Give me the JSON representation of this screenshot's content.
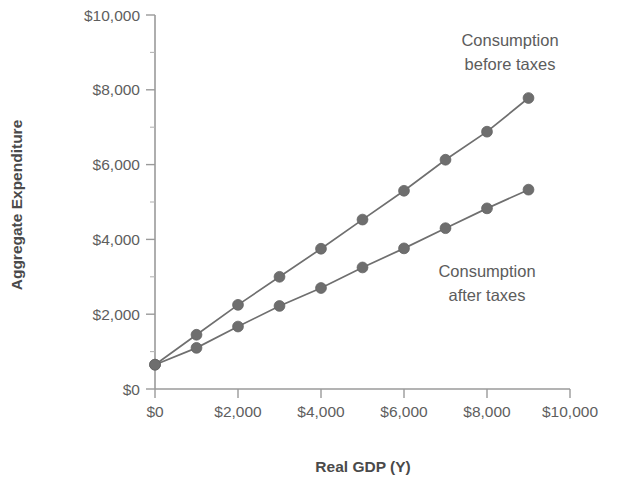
{
  "chart_data": {
    "type": "line",
    "title": "",
    "xlabel": "Real GDP (Y)",
    "ylabel": "Aggregate Expenditure",
    "xlim": [
      0,
      10000
    ],
    "ylim": [
      0,
      10000
    ],
    "grid": false,
    "legend_position": "inline-annotation",
    "x": [
      0,
      1000,
      2000,
      3000,
      4000,
      5000,
      6000,
      7000,
      8000,
      9000
    ],
    "series": [
      {
        "name": "Consumption before taxes",
        "values": [
          650,
          1450,
          2250,
          3000,
          3750,
          4530,
          5300,
          6130,
          6880,
          7780
        ],
        "color": "#6e6e6e"
      },
      {
        "name": "Consumption after taxes",
        "values": [
          650,
          1100,
          1670,
          2220,
          2700,
          3250,
          3760,
          4300,
          4830,
          5330
        ],
        "color": "#6e6e6e"
      }
    ],
    "x_tick_values": [
      0,
      2000,
      4000,
      6000,
      8000,
      10000
    ],
    "x_tick_labels": [
      "$0",
      "$2,000",
      "$4,000",
      "$6,000",
      "$8,000",
      "$10,000"
    ],
    "y_tick_values": [
      0,
      2000,
      4000,
      6000,
      8000,
      10000
    ],
    "y_tick_labels": [
      "$0",
      "$2,000",
      "$4,000",
      "$6,000",
      "$8,000",
      "$10,000"
    ],
    "y_minor_tick_values": [
      1000,
      3000,
      5000,
      7000,
      9000
    ],
    "annotations": [
      {
        "text_line1": "Consumption",
        "text_line2": "before taxes",
        "x": 7600,
        "y": 9150
      },
      {
        "text_line1": "Consumption",
        "text_line2": "after taxes",
        "x": 7150,
        "y": 3300
      }
    ]
  },
  "axis": {
    "y_title": "Aggregate Expenditure",
    "x_title": "Real GDP (Y)"
  },
  "y_ticks": [
    {
      "label": "$10,000"
    },
    {
      "label": "$8,000"
    },
    {
      "label": "$6,000"
    },
    {
      "label": "$4,000"
    },
    {
      "label": "$2,000"
    },
    {
      "label": "$0"
    }
  ],
  "x_ticks": [
    {
      "label": "$0"
    },
    {
      "label": "$2,000"
    },
    {
      "label": "$4,000"
    },
    {
      "label": "$6,000"
    },
    {
      "label": "$8,000"
    },
    {
      "label": "$10,000"
    }
  ],
  "annotations": {
    "upper": {
      "line1": "Consumption",
      "line2": "before taxes"
    },
    "lower": {
      "line1": "Consumption",
      "line2": "after taxes"
    }
  },
  "colors": {
    "series": "#6e6e6e",
    "axis": "#9a9a9a",
    "text": "#5e5e5e",
    "background": "#ffffff"
  }
}
